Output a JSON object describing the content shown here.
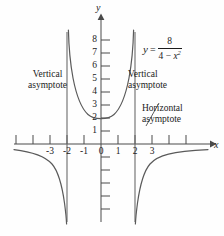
{
  "figure": {
    "equation": {
      "lhs": "y",
      "equals": "=",
      "numerator": "8",
      "denominator_left": "4 − ",
      "denominator_var": "x",
      "denominator_exp": "2"
    },
    "axis_labels": {
      "x": "x",
      "y": "y"
    },
    "annotations": {
      "vertical_left": {
        "line1": "Vertical",
        "line2": "asymptote"
      },
      "vertical_right": {
        "line1": "Vertical",
        "line2": "asymptote"
      },
      "horizontal": {
        "line1": "Horizontal",
        "line2": "asymptote"
      }
    }
  },
  "chart_data": {
    "type": "line",
    "title": "",
    "subtitle": "",
    "equation_text": "y = 8 / (4 - x^2)",
    "xlabel": "x",
    "ylabel": "y",
    "xlim": [
      -4.9,
      4.9
    ],
    "ylim": [
      -9.2,
      8.9
    ],
    "grid": false,
    "legend_position": "none",
    "x_tick_labels": [
      "-3",
      "-2",
      "-1",
      "0",
      "1",
      "2",
      "3"
    ],
    "x_tick_values": [
      -3,
      -2,
      -1,
      0,
      1,
      2,
      3
    ],
    "x_ticks_unlabeled": [
      -4.5,
      -4,
      3.5,
      4,
      4.5
    ],
    "y_tick_labels": [
      "1",
      "2",
      "3",
      "4",
      "5",
      "6",
      "7",
      "8"
    ],
    "y_tick_values": [
      1,
      2,
      3,
      4,
      5,
      6,
      7,
      8
    ],
    "y_ticks_unlabeled": [
      -1,
      -2,
      -3,
      -4,
      -5,
      -6,
      -7
    ],
    "asymptotes": {
      "vertical": [
        -2,
        2
      ],
      "horizontal": [
        0
      ]
    },
    "key_points": [
      {
        "x": 0,
        "y": 2,
        "note": "local minimum of central branch"
      }
    ],
    "series": [
      {
        "name": "left branch (x < -2)",
        "points": [
          {
            "x": -4.8,
            "y": -0.43
          },
          {
            "x": -4.5,
            "y": -0.5
          },
          {
            "x": -4.0,
            "y": -0.67
          },
          {
            "x": -3.5,
            "y": -0.98
          },
          {
            "x": -3.2,
            "y": -1.29
          },
          {
            "x": -3.0,
            "y": -1.6
          },
          {
            "x": -2.8,
            "y": -2.05
          },
          {
            "x": -2.6,
            "y": -2.76
          },
          {
            "x": -2.4,
            "y": -4.0
          },
          {
            "x": -2.3,
            "y": -4.98
          },
          {
            "x": -2.2,
            "y": -6.67
          },
          {
            "x": -2.12,
            "y": -8.35
          },
          {
            "x": -2.08,
            "y": -9.2
          }
        ]
      },
      {
        "name": "central branch (-2 < x < 2)",
        "points": [
          {
            "x": -1.94,
            "y": 8.9
          },
          {
            "x": -1.9,
            "y": 8.2
          },
          {
            "x": -1.8,
            "y": 6.67
          },
          {
            "x": -1.7,
            "y": 5.78
          },
          {
            "x": -1.5,
            "y": 4.57
          },
          {
            "x": -1.25,
            "y": 3.37
          },
          {
            "x": -1.0,
            "y": 2.67
          },
          {
            "x": -0.75,
            "y": 2.32
          },
          {
            "x": -0.5,
            "y": 2.13
          },
          {
            "x": 0,
            "y": 2.0
          },
          {
            "x": 0.5,
            "y": 2.13
          },
          {
            "x": 0.75,
            "y": 2.32
          },
          {
            "x": 1.0,
            "y": 2.67
          },
          {
            "x": 1.25,
            "y": 3.37
          },
          {
            "x": 1.5,
            "y": 4.57
          },
          {
            "x": 1.7,
            "y": 5.78
          },
          {
            "x": 1.8,
            "y": 6.67
          },
          {
            "x": 1.9,
            "y": 8.2
          },
          {
            "x": 1.94,
            "y": 8.9
          }
        ]
      },
      {
        "name": "right branch (x > 2)",
        "points": [
          {
            "x": 2.08,
            "y": -9.2
          },
          {
            "x": 2.12,
            "y": -8.35
          },
          {
            "x": 2.2,
            "y": -6.67
          },
          {
            "x": 2.3,
            "y": -4.98
          },
          {
            "x": 2.4,
            "y": -4.0
          },
          {
            "x": 2.6,
            "y": -2.76
          },
          {
            "x": 2.8,
            "y": -2.05
          },
          {
            "x": 3.0,
            "y": -1.6
          },
          {
            "x": 3.2,
            "y": -1.29
          },
          {
            "x": 3.5,
            "y": -0.98
          },
          {
            "x": 4.0,
            "y": -0.67
          },
          {
            "x": 4.5,
            "y": -0.5
          },
          {
            "x": 4.8,
            "y": -0.43
          }
        ]
      }
    ]
  },
  "style": {
    "curve_color": "#5a5a5a",
    "asymptote_color": "#6b6b6b",
    "axis_color": "#4a4a4a",
    "text_color": "#1b1b1b",
    "background": "#fefefe"
  }
}
